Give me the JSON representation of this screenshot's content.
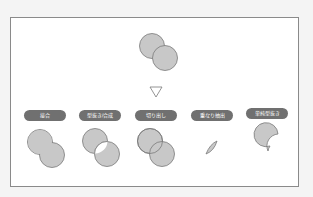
{
  "diagram": {
    "source_shape": "two-overlapping-circles",
    "arrow": "down-triangle",
    "operations": [
      {
        "label": "接合",
        "result": "union"
      },
      {
        "label": "型抜き/合成",
        "result": "combine"
      },
      {
        "label": "切り出し",
        "result": "fragment"
      },
      {
        "label": "重なり抽出",
        "result": "intersect"
      },
      {
        "label": "単純型抜き",
        "result": "subtract"
      }
    ],
    "colors": {
      "fill": "#c8c8c8",
      "stroke": "#7a7a7a",
      "pill": "#707070",
      "pill_text": "#ffffff"
    }
  }
}
